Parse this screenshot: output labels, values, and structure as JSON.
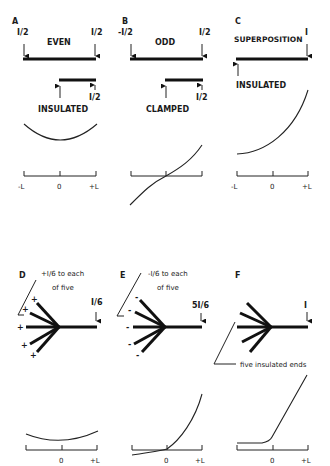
{
  "panels": {
    "A": {
      "letter": "A",
      "title": "EVEN",
      "left_load": "I/2",
      "right_load": "I/2",
      "half_label": "INSULATED",
      "half_load": "I/2",
      "axis": {
        "left": "-L",
        "center": "0",
        "right": "+L"
      }
    },
    "B": {
      "letter": "B",
      "title": "ODD",
      "left_load": "-I/2",
      "right_load": "I/2",
      "half_label": "CLAMPED",
      "half_load": "I/2"
    },
    "C": {
      "letter": "C",
      "title": "SUPERPOSITION",
      "right_load": "I",
      "left_label": "INSULATED",
      "axis": {
        "left": "-L",
        "center": "0",
        "right": "+L"
      }
    },
    "D": {
      "letter": "D",
      "caption_line1": "+I/6 to each",
      "caption_line2": "of  five",
      "right_load": "I/6",
      "signs": [
        "+",
        "+",
        "+",
        "+",
        "+"
      ],
      "axis": {
        "center": "0",
        "right": "+L"
      }
    },
    "E": {
      "letter": "E",
      "caption_line1": "-I/6 to each",
      "caption_line2": "of  five",
      "right_load": "5I/6",
      "signs": [
        "-",
        "-",
        "-",
        "-",
        "-"
      ],
      "axis": {
        "center": "0",
        "right": "+L"
      }
    },
    "F": {
      "letter": "F",
      "right_load": "I",
      "caption": "five insulated ends",
      "axis": {
        "center": "0",
        "right": "+L"
      }
    }
  }
}
